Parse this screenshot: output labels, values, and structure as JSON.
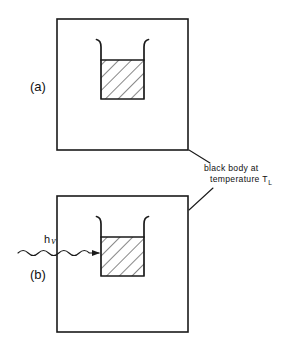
{
  "figure": {
    "type": "diagram",
    "background_color": "#ffffff",
    "line_color": "#1a1a1a",
    "width": 297,
    "height": 350
  },
  "panels": [
    {
      "id": "a",
      "label": "(a)",
      "label_x": 30,
      "label_y": 91,
      "enclosure": {
        "x": 57,
        "y": 19,
        "width": 131,
        "height": 131
      },
      "vessel": {
        "box": {
          "x": 101,
          "y": 60,
          "width": 43,
          "height": 39
        },
        "fill": "diagonal-hatch",
        "lip_height": 18
      },
      "has_incident_radiation": false
    },
    {
      "id": "b",
      "label": "(b)",
      "label_x": 30,
      "label_y": 279,
      "enclosure": {
        "x": 57,
        "y": 196,
        "width": 131,
        "height": 136
      },
      "vessel": {
        "box": {
          "x": 101,
          "y": 237,
          "width": 43,
          "height": 39
        },
        "fill": "diagonal-hatch",
        "lip_height": 18
      },
      "has_incident_radiation": true,
      "incident_radiation": {
        "label_main": "h",
        "label_symbol": "ν",
        "label_x": 44,
        "label_y": 243,
        "wave_start_x": 18,
        "wave_end_x": 100,
        "wave_y": 253,
        "arrowhead": "right"
      }
    }
  ],
  "annotation": {
    "id": "black-body-caption",
    "line1": "black body at",
    "line2_prefix": "temperature T",
    "line2_subscript": "L",
    "line1_x": 204,
    "line1_y": 171,
    "line2_x": 210,
    "line2_y": 182,
    "leader_a": {
      "x1": 189,
      "y1": 150,
      "x2": 210,
      "y2": 163
    },
    "leader_b": {
      "x1": 189,
      "y1": 210,
      "x2": 213,
      "y2": 188
    }
  }
}
